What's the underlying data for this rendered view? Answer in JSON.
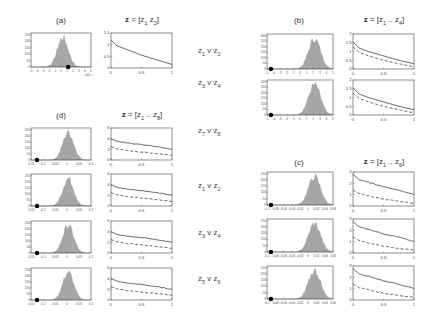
{
  "labels": {
    "a": "(a)",
    "b": "(b)",
    "c": "(c)",
    "d": "(d)",
    "title_a": "z = [z1 z2]",
    "title_b": "z = [z1 .. z4]",
    "title_c": "z = [z1 .. z6]",
    "title_d": "z = [z1 .. z8]",
    "mid": [
      "z1 v z2",
      "z3 v z4",
      "z7 v z8",
      "z1 v z2",
      "z3 v z4",
      "z5 v z6"
    ]
  },
  "chart_data": [
    {
      "panel": "(a)",
      "type": "bar",
      "kind": "histogram",
      "yticks": [
        0,
        50,
        100,
        150,
        200,
        250
      ],
      "xtick_count": 11,
      "x_multiplier": "x10^-3",
      "marker_x_fraction": 0.62,
      "peak_fraction": 0.53
    },
    {
      "panel": "(a)",
      "type": "line",
      "title": "z = [z1 z2]",
      "x": [
        0,
        0.1,
        0.25,
        0.5,
        0.75,
        1
      ],
      "xlim": [
        0,
        1
      ],
      "ylim": [
        0,
        1.5
      ],
      "xticks": [
        0,
        0.5,
        1
      ],
      "yticks": [
        0,
        0.5,
        1,
        1.5
      ],
      "series": [
        {
          "name": "solid",
          "style": "solid",
          "values": [
            1.2,
            0.95,
            0.8,
            0.55,
            0.35,
            0.15
          ]
        }
      ]
    },
    {
      "panel": "(b)",
      "type": "bar",
      "kind": "histogram",
      "rows": [
        "z1 v z2",
        "z3 v z4"
      ],
      "yticks": [
        0,
        50,
        100,
        150,
        200,
        250,
        300
      ],
      "marker_x_fraction": 0.06,
      "peak_fraction": 0.72
    },
    {
      "panel": "(b)",
      "type": "line",
      "title": "z = [z1 .. z4]",
      "rows": [
        "z1 v z2",
        "z3 v z4"
      ],
      "x": [
        0,
        0.1,
        0.25,
        0.5,
        0.75,
        1
      ],
      "xlim": [
        0,
        1
      ],
      "ylim": [
        0,
        2
      ],
      "xticks": [
        0,
        0.5,
        1
      ],
      "yticks": [
        0,
        0.5,
        1,
        1.5,
        2
      ],
      "series": [
        {
          "name": "solid",
          "style": "solid",
          "values": [
            1.55,
            1.2,
            1.0,
            0.75,
            0.5,
            0.3
          ]
        },
        {
          "name": "dashed",
          "style": "dashed",
          "values": [
            1.25,
            0.95,
            0.75,
            0.5,
            0.3,
            0.12
          ]
        }
      ]
    },
    {
      "panel": "(d)",
      "type": "bar",
      "kind": "histogram",
      "rows": [
        "z7 v z8",
        "z1 v z2",
        "z3 v z4",
        "z5 v z6"
      ],
      "xticks": [
        -0.15,
        -0.1,
        -0.05,
        0,
        0.05,
        0.1
      ],
      "yticks": [
        0,
        50,
        100,
        150,
        200,
        250
      ],
      "marker_x_fraction": 0.1,
      "peak_fraction": 0.62
    },
    {
      "panel": "(d)",
      "type": "line",
      "title": "z = [z1 .. z8]",
      "rows": [
        "z7 v z8",
        "z1 v z2",
        "z3 v z4",
        "z5 v z6"
      ],
      "x": [
        0,
        0.1,
        0.25,
        0.5,
        0.75,
        1
      ],
      "xlim": [
        0,
        1
      ],
      "ylim": [
        0,
        6
      ],
      "xticks": [
        0,
        0.5,
        1
      ],
      "yticks": [
        0,
        2,
        4,
        6
      ],
      "series": [
        {
          "name": "solid",
          "style": "solid",
          "values": [
            4.0,
            3.5,
            3.2,
            2.9,
            2.5,
            2.0
          ]
        },
        {
          "name": "dashed",
          "style": "dashed",
          "values": [
            2.5,
            2.1,
            1.8,
            1.5,
            1.2,
            0.9
          ]
        }
      ]
    },
    {
      "panel": "(c)",
      "type": "bar",
      "kind": "histogram",
      "rows": [
        "z1 v z2",
        "z3 v z4",
        "z5 v z6"
      ],
      "xticks": [
        -0.1,
        -0.08,
        -0.06,
        -0.04,
        -0.02,
        0,
        0.02,
        0.04,
        0.06
      ],
      "yticks": [
        0,
        50,
        100,
        150,
        200,
        250
      ],
      "marker_x_fraction": 0.06,
      "peak_fraction": 0.72
    },
    {
      "panel": "(c)",
      "type": "line",
      "title": "z = [z1 .. z6]",
      "rows": [
        "z1 v z2",
        "z3 v z4",
        "z5 v z6"
      ],
      "x": [
        0,
        0.1,
        0.25,
        0.5,
        0.75,
        1
      ],
      "xlim": [
        0,
        1
      ],
      "ylim": [
        0,
        3
      ],
      "xticks": [
        0,
        0.5,
        1
      ],
      "yticks": [
        0,
        1,
        2,
        3
      ],
      "series": [
        {
          "name": "solid",
          "style": "solid",
          "values": [
            2.8,
            2.3,
            2.1,
            1.7,
            1.4,
            1.0
          ]
        },
        {
          "name": "dashed",
          "style": "dashed",
          "values": [
            1.4,
            1.1,
            0.9,
            0.6,
            0.4,
            0.25
          ]
        }
      ]
    }
  ]
}
